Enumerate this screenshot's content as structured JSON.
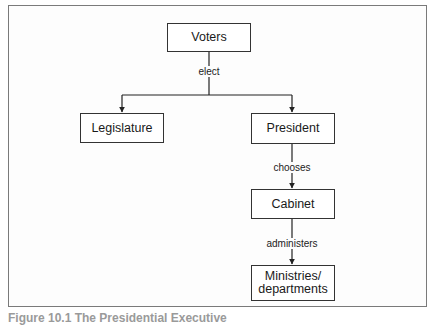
{
  "diagram": {
    "nodes": {
      "voters": "Voters",
      "legislature": "Legislature",
      "president": "President",
      "cabinet": "Cabinet",
      "ministries_line1": "Ministries/",
      "ministries_line2": "departments"
    },
    "edges": {
      "elect": "elect",
      "chooses": "chooses",
      "administers": "administers"
    },
    "caption": "Figure 10.1  The Presidential Executive"
  }
}
